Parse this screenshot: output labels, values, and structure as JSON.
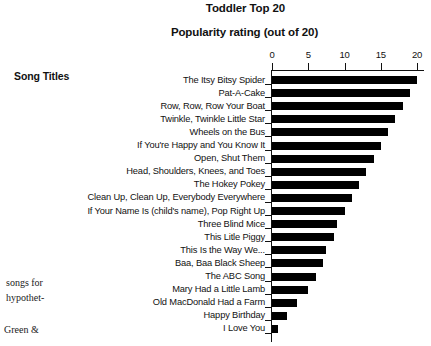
{
  "figure": {
    "title": "Toddler Top 20",
    "axis_title": "Popularity rating (out of 20)",
    "row_header": "Song Titles"
  },
  "margin_text": {
    "line1": "songs for",
    "line2": "hypothet-",
    "line3": "Green &"
  },
  "chart_data": {
    "type": "bar",
    "orientation": "horizontal",
    "title": "Toddler Top 20",
    "xlabel": "Popularity rating (out of 20)",
    "ylabel": "Song Titles",
    "xlim": [
      0,
      20
    ],
    "xticks": [
      0,
      5,
      10,
      15,
      20
    ],
    "grid": false,
    "legend": null,
    "bar_color": "#000000",
    "categories": [
      "The Itsy Bitsy Spider",
      "Pat-A-Cake",
      "Row, Row, Row Your Boat",
      "Twinkle, Twinkle Little Star",
      "Wheels on the Bus",
      "If You're Happy and You Know It",
      "Open, Shut Them",
      "Head, Shoulders, Knees, and Toes",
      "The Hokey Pokey",
      "Clean Up, Clean Up, Everybody Everywhere",
      "If Your Name Is (child's name), Pop Right Up",
      "Three Blind Mice",
      "This Litle Piggy",
      "This Is the Way We...",
      "Baa, Baa Black Sheep",
      "The ABC Song",
      "Mary Had a Little Lamb",
      "Old MacDonald Had a Farm",
      "Happy Birthday",
      "I Love You"
    ],
    "values": [
      20,
      19,
      18,
      17,
      16,
      15,
      14,
      13,
      12,
      11,
      10,
      9,
      8.5,
      7.5,
      7,
      6,
      5,
      3.5,
      2,
      0.8
    ]
  }
}
